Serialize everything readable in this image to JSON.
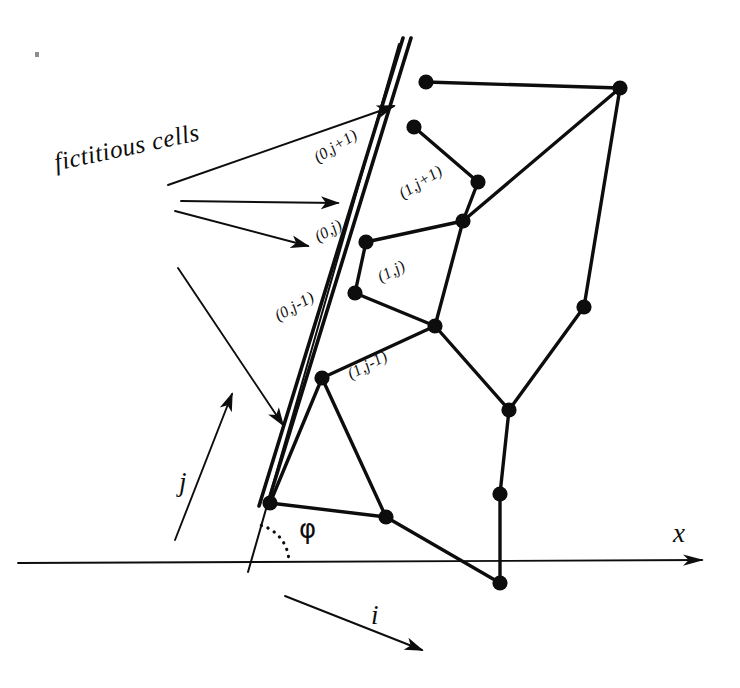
{
  "figure": {
    "background_color": "#ffffff",
    "ink_color": "#0d0d0d"
  },
  "caption": {
    "text": "fictitious cells",
    "rotation_deg": -12
  },
  "cell_labels": [
    {
      "id": "fict-j-plus-1",
      "text": "(0,j+1)",
      "x": 311,
      "y": 152,
      "rotation_deg": -32
    },
    {
      "id": "real-j-plus-1",
      "text": "(1,j+1)",
      "x": 396,
      "y": 188,
      "rotation_deg": -32
    },
    {
      "id": "fict-j",
      "text": "(0,j)",
      "x": 312,
      "y": 231,
      "rotation_deg": -30
    },
    {
      "id": "real-j",
      "text": "(1,j)",
      "x": 375,
      "y": 271,
      "rotation_deg": -28
    },
    {
      "id": "fict-j-minus-1",
      "text": "(0,j-1)",
      "x": 272,
      "y": 310,
      "rotation_deg": -30
    },
    {
      "id": "real-j-minus-1",
      "text": "(1,j-1)",
      "x": 345,
      "y": 368,
      "rotation_deg": -28
    }
  ],
  "axis_labels": [
    {
      "id": "x-axis-label",
      "text": "x",
      "x": 673,
      "y": 520
    },
    {
      "id": "i-index-label",
      "text": "i",
      "x": 371,
      "y": 602
    },
    {
      "id": "j-index-label",
      "text": "j",
      "x": 179,
      "y": 469
    }
  ],
  "angle_label": {
    "id": "phi-angle-label",
    "text": "φ",
    "x": 299,
    "y": 516
  },
  "geometry": {
    "x_axis": {
      "x1": 18,
      "y1": 563,
      "x2": 702,
      "y2": 560
    },
    "boundary_double_line": {
      "description": "inclined double line marking the body surface",
      "angle_phi_deg": 75,
      "outer": {
        "x1": 411,
        "y1": 38,
        "x2": 267,
        "y2": 506
      },
      "inner": {
        "x1": 403,
        "y1": 38,
        "x2": 259,
        "y2": 506
      },
      "thin_extension": {
        "x1": 399,
        "y1": 44,
        "x2": 248,
        "y2": 572
      }
    },
    "nodes": [
      {
        "id": "n1",
        "x": 426,
        "y": 82
      },
      {
        "id": "n2",
        "x": 620,
        "y": 88
      },
      {
        "id": "n3",
        "x": 414,
        "y": 127
      },
      {
        "id": "n4",
        "x": 478,
        "y": 182
      },
      {
        "id": "n5",
        "x": 463,
        "y": 221
      },
      {
        "id": "n6",
        "x": 584,
        "y": 307
      },
      {
        "id": "n7",
        "x": 366,
        "y": 242
      },
      {
        "id": "n8",
        "x": 355,
        "y": 293
      },
      {
        "id": "n9",
        "x": 435,
        "y": 326
      },
      {
        "id": "n10",
        "x": 509,
        "y": 410
      },
      {
        "id": "n11",
        "x": 322,
        "y": 378
      },
      {
        "id": "n12",
        "x": 270,
        "y": 503
      },
      {
        "id": "n13",
        "x": 386,
        "y": 517
      },
      {
        "id": "n14",
        "x": 500,
        "y": 583
      },
      {
        "id": "n15",
        "x": 500,
        "y": 494
      }
    ],
    "edges": [
      [
        "n1",
        "n2"
      ],
      [
        "n2",
        "n5"
      ],
      [
        "n2",
        "n6"
      ],
      [
        "n3",
        "n4"
      ],
      [
        "n4",
        "n5"
      ],
      [
        "n5",
        "n9"
      ],
      [
        "n5",
        "n7"
      ],
      [
        "n7",
        "n8"
      ],
      [
        "n8",
        "n9"
      ],
      [
        "n9",
        "n10"
      ],
      [
        "n9",
        "n11"
      ],
      [
        "n10",
        "n6"
      ],
      [
        "n10",
        "n15"
      ],
      [
        "n11",
        "n12"
      ],
      [
        "n11",
        "n13"
      ],
      [
        "n12",
        "n13"
      ],
      [
        "n13",
        "n14"
      ],
      [
        "n15",
        "n14"
      ]
    ]
  },
  "arrows": [
    {
      "id": "fictitious-arrow-up",
      "x1": 168,
      "y1": 185,
      "x2": 394,
      "y2": 106
    },
    {
      "id": "fictitious-arrow-mid",
      "x1": 181,
      "y1": 201,
      "x2": 338,
      "y2": 203
    },
    {
      "id": "fictitious-arrow-down",
      "x1": 175,
      "y1": 211,
      "x2": 308,
      "y2": 246
    },
    {
      "id": "fictitious-arrow-lower",
      "x1": 178,
      "y1": 268,
      "x2": 283,
      "y2": 425
    },
    {
      "id": "j-direction-arrow",
      "x1": 175,
      "y1": 540,
      "x2": 232,
      "y2": 394
    },
    {
      "id": "i-direction-arrow",
      "x1": 285,
      "y1": 596,
      "x2": 422,
      "y2": 650
    },
    {
      "id": "x-axis-arrow",
      "x1": 18,
      "y1": 563,
      "x2": 702,
      "y2": 560
    }
  ],
  "phi_arc": {
    "id": "phi-dotted-arc",
    "description": "dotted arc between x-axis and inclined boundary"
  },
  "speck": {
    "x": 35,
    "y": 52
  }
}
